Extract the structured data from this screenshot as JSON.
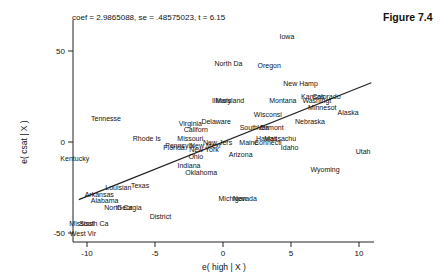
{
  "header": {
    "stats": "coef = 2.9865088, se = .48575023, t = 6.15",
    "figure_label": "Figure 7.4"
  },
  "chart_data": {
    "type": "scatter",
    "title": "coef = 2.9865088, se = .48575023, t = 6.15",
    "xlabel": "e( high | X )",
    "ylabel": "e( csat | X )",
    "xlim": [
      -11,
      11
    ],
    "ylim": [
      -55,
      62
    ],
    "xticks": [
      -10,
      -5,
      0,
      5,
      10
    ],
    "yticks": [
      -50,
      0,
      50
    ],
    "grid": false,
    "legend": "none",
    "fit_line": {
      "slope": 2.9865088,
      "intercept": 0,
      "x_range": [
        -10.6,
        10.9
      ]
    },
    "points": [
      {
        "label": "Iowa",
        "x": 4.7,
        "y": 58
      },
      {
        "label": "North Da",
        "x": 0.4,
        "y": 43
      },
      {
        "label": "Oregon",
        "x": 3.4,
        "y": 42
      },
      {
        "label": "New Hamp",
        "x": 5.7,
        "y": 32
      },
      {
        "label": "Kansas",
        "x": 6.6,
        "y": 25
      },
      {
        "label": "Colorado",
        "x": 7.6,
        "y": 25
      },
      {
        "label": "Washingt",
        "x": 6.9,
        "y": 23
      },
      {
        "label": "Montana",
        "x": 4.4,
        "y": 23
      },
      {
        "label": "Illinois",
        "x": -0.1,
        "y": 23
      },
      {
        "label": "Maryland",
        "x": 0.5,
        "y": 23
      },
      {
        "label": "Minnesot",
        "x": 7.3,
        "y": 19
      },
      {
        "label": "Alaska",
        "x": 9.2,
        "y": 16
      },
      {
        "label": "Wisconsi",
        "x": 3.3,
        "y": 15
      },
      {
        "label": "Tennesse",
        "x": -8.6,
        "y": 13
      },
      {
        "label": "Delaware",
        "x": -0.5,
        "y": 11
      },
      {
        "label": "Nebraska",
        "x": 6.4,
        "y": 11
      },
      {
        "label": "Virginia",
        "x": -2.4,
        "y": 10
      },
      {
        "label": "South Da",
        "x": 2.3,
        "y": 8
      },
      {
        "label": "Vermont",
        "x": 3.5,
        "y": 8
      },
      {
        "label": "Californ",
        "x": -2.0,
        "y": 7
      },
      {
        "label": "Rhode Is",
        "x": -5.6,
        "y": 2
      },
      {
        "label": "Missouri",
        "x": -2.4,
        "y": 2
      },
      {
        "label": "Hawaii",
        "x": 3.2,
        "y": 2
      },
      {
        "label": "Massachu",
        "x": 4.2,
        "y": 2
      },
      {
        "label": "New Jers",
        "x": -0.4,
        "y": 0
      },
      {
        "label": "Maine",
        "x": 1.9,
        "y": 0
      },
      {
        "label": "Connecti",
        "x": 3.3,
        "y": 0
      },
      {
        "label": "Pennsylv",
        "x": -3.2,
        "y": -2
      },
      {
        "label": "New Mexi",
        "x": -1.3,
        "y": -2
      },
      {
        "label": "Florida",
        "x": -3.6,
        "y": -3
      },
      {
        "label": "New York",
        "x": -1.4,
        "y": -4
      },
      {
        "label": "Idaho",
        "x": 4.9,
        "y": -3
      },
      {
        "label": "Utah",
        "x": 10.3,
        "y": -5
      },
      {
        "label": "Arizona",
        "x": 1.3,
        "y": -7
      },
      {
        "label": "Ohio",
        "x": -2.0,
        "y": -8
      },
      {
        "label": "Kentucky",
        "x": -10.9,
        "y": -9
      },
      {
        "label": "Indiana",
        "x": -2.5,
        "y": -13
      },
      {
        "label": "Wyoming",
        "x": 7.5,
        "y": -15
      },
      {
        "label": "Oklahoma",
        "x": -1.6,
        "y": -17
      },
      {
        "label": "Texas",
        "x": -6.1,
        "y": -24
      },
      {
        "label": "Louisian",
        "x": -7.7,
        "y": -25
      },
      {
        "label": "Michigan",
        "x": 0.7,
        "y": -31
      },
      {
        "label": "Nevada",
        "x": 1.6,
        "y": -31
      },
      {
        "label": "Arkansas",
        "x": -9.1,
        "y": -29
      },
      {
        "label": "Alabama",
        "x": -8.7,
        "y": -32
      },
      {
        "label": "North Ca",
        "x": -7.7,
        "y": -36
      },
      {
        "label": "Georgia",
        "x": -6.9,
        "y": -36
      },
      {
        "label": "District",
        "x": -4.6,
        "y": -41
      },
      {
        "label": "Mississi",
        "x": -10.4,
        "y": -45
      },
      {
        "label": "South Ca",
        "x": -9.5,
        "y": -45
      },
      {
        "label": "West Vir",
        "x": -10.3,
        "y": -50
      }
    ]
  }
}
